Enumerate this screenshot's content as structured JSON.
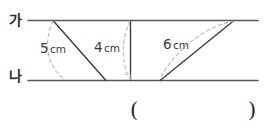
{
  "figure": {
    "type": "geometry-diagram",
    "line_labels": {
      "top": "가",
      "bottom": "나"
    },
    "segments": [
      {
        "id": "left",
        "value": "5",
        "unit": "cm",
        "label": "5 cm",
        "orientation": "slanted-down-right"
      },
      {
        "id": "middle",
        "value": "4",
        "unit": "cm",
        "label": "4 cm",
        "orientation": "vertical"
      },
      {
        "id": "right",
        "value": "6",
        "unit": "cm",
        "label": "6 cm",
        "orientation": "slanted-up-right"
      }
    ],
    "colors": {
      "line": "#555555",
      "segment": "#3d3d3d",
      "arc": "#b9b9b9",
      "text": "#2b2b2b"
    }
  },
  "answer": {
    "open_paren": "(",
    "close_paren": ")",
    "value": ""
  }
}
